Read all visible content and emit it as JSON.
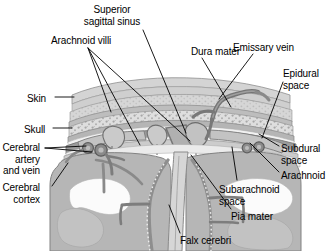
{
  "figure": {
    "width": 330,
    "height": 251,
    "background": "#ffffff"
  },
  "palette": {
    "skin_outer": "#d8d8d8",
    "skin_inner": "#c9c9c9",
    "diploe": "#dcdcdc",
    "bone": "#b9b9b9",
    "dura": "#9a9a9a",
    "arachnoid": "#d2d2d2",
    "subarachnoid": "#e9e9e9",
    "brain": "#b4b4b4",
    "brain_light": "#c6c6c6",
    "vessel": "#7e7e7e",
    "vessel_dark": "#6a6a6a",
    "white_matter": "#fbfbfb",
    "leader": "#000000",
    "text": "#000000"
  },
  "labels": [
    {
      "id": "superior-sagittal-sinus",
      "text": "Superior\nsagittal sinus",
      "x": 112,
      "y": 4,
      "align": "center",
      "lines": 2
    },
    {
      "id": "arachnoid-villi",
      "text": "Arachnoid villi",
      "x": 51,
      "y": 35,
      "align": "left",
      "lines": 1
    },
    {
      "id": "dura-mater",
      "text": "Dura mater",
      "x": 191,
      "y": 46,
      "align": "left",
      "lines": 1
    },
    {
      "id": "emissary-vein",
      "text": "Emissary vein",
      "x": 233,
      "y": 42,
      "align": "left",
      "lines": 1
    },
    {
      "id": "epidural-space",
      "text": "Epidural\nspace",
      "x": 283,
      "y": 68,
      "align": "left",
      "lines": 2
    },
    {
      "id": "skin",
      "text": "Skin",
      "x": 27,
      "y": 93,
      "align": "left",
      "lines": 1
    },
    {
      "id": "skull",
      "text": "Skull",
      "x": 24,
      "y": 124,
      "align": "left",
      "lines": 1
    },
    {
      "id": "cerebral-artery-and-vein",
      "text": "Cerebral\nartery\nand vein",
      "x": 40,
      "y": 142,
      "align": "right",
      "lines": 3
    },
    {
      "id": "cerebral-cortex",
      "text": "Cerebral\ncortex",
      "x": 40,
      "y": 182,
      "align": "right",
      "lines": 2
    },
    {
      "id": "subdural-space",
      "text": "Subdural\nspace",
      "x": 281,
      "y": 143,
      "align": "left",
      "lines": 2
    },
    {
      "id": "arachnoid",
      "text": "Arachnoid",
      "x": 281,
      "y": 170,
      "align": "left",
      "lines": 1
    },
    {
      "id": "subarachnoid-space",
      "text": "Subarachnoid\nspace",
      "x": 219,
      "y": 184,
      "align": "left",
      "lines": 2
    },
    {
      "id": "pia-mater",
      "text": "Pia mater",
      "x": 231,
      "y": 211,
      "align": "left",
      "lines": 1
    },
    {
      "id": "falx-cerebri",
      "text": "Falx cerebri",
      "x": 180,
      "y": 235,
      "align": "left",
      "lines": 1
    }
  ],
  "leaders": [
    {
      "id": "leader-superior-sagittal-sinus",
      "points": "143,30 186,133"
    },
    {
      "id": "leader-arachnoid-villi-1",
      "points": "88,48 111,112"
    },
    {
      "id": "leader-arachnoid-villi-2",
      "points": "88,48 140,145"
    },
    {
      "id": "leader-arachnoid-villi-3",
      "points": "88,48 190,141"
    },
    {
      "id": "leader-dura-mater",
      "points": "202,58 231,107"
    },
    {
      "id": "leader-emissary-vein",
      "points": "253,54 219,99"
    },
    {
      "id": "leader-epidural-space",
      "points": "283,82 262,138"
    },
    {
      "id": "leader-skin",
      "points": "55,97 74,97"
    },
    {
      "id": "leader-skull",
      "points": "53,128 72,128"
    },
    {
      "id": "leader-cerebral-artery-1",
      "points": "45,148 86,146"
    },
    {
      "id": "leader-cerebral-artery-2",
      "points": "45,148 92,152"
    },
    {
      "id": "leader-cerebral-cortex",
      "points": "52,186 68,163"
    },
    {
      "id": "leader-subdural-space",
      "points": "279,146 259,134"
    },
    {
      "id": "leader-arachnoid",
      "points": "279,172 250,143"
    },
    {
      "id": "leader-subarachnoid-space",
      "points": "237,180 232,147"
    },
    {
      "id": "leader-pia-mater",
      "points": "231,209 191,155"
    },
    {
      "id": "leader-falx-cerebri",
      "points": "180,233 169,205"
    }
  ]
}
